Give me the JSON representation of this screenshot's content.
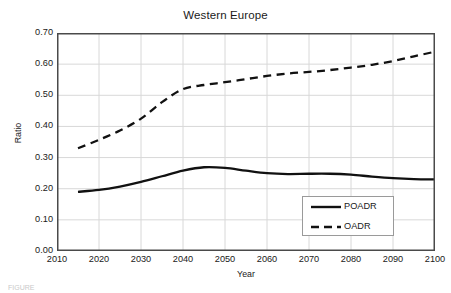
{
  "chart_data": {
    "type": "line",
    "title": "Western Europe",
    "xlabel": "Year",
    "ylabel": "Ratio",
    "xlim": [
      2010,
      2100
    ],
    "ylim": [
      0.0,
      0.7
    ],
    "grid": true,
    "legend_position": "lower-right",
    "xticks": [
      "2010",
      "2020",
      "2030",
      "2040",
      "2050",
      "2060",
      "2070",
      "2080",
      "2090",
      "2100"
    ],
    "yticks": [
      "0.00",
      "0.10",
      "0.20",
      "0.30",
      "0.40",
      "0.50",
      "0.60",
      "0.70"
    ],
    "x": [
      2015,
      2020,
      2025,
      2030,
      2035,
      2040,
      2045,
      2050,
      2055,
      2060,
      2065,
      2070,
      2075,
      2080,
      2085,
      2090,
      2095,
      2100
    ],
    "series": [
      {
        "name": "POADR",
        "style": "solid",
        "color": "#111111",
        "values": [
          0.19,
          0.196,
          0.207,
          0.222,
          0.24,
          0.258,
          0.269,
          0.267,
          0.258,
          0.25,
          0.247,
          0.248,
          0.248,
          0.245,
          0.239,
          0.234,
          0.231,
          0.23
        ]
      },
      {
        "name": "OADR",
        "style": "dashed",
        "color": "#111111",
        "values": [
          0.33,
          0.357,
          0.387,
          0.425,
          0.478,
          0.52,
          0.533,
          0.542,
          0.552,
          0.562,
          0.57,
          0.575,
          0.581,
          0.589,
          0.598,
          0.61,
          0.625,
          0.64
        ]
      }
    ]
  },
  "legend": {
    "items": [
      {
        "label": "POADR",
        "style": "solid"
      },
      {
        "label": "OADR",
        "style": "dashed"
      }
    ]
  },
  "caption": {
    "text": "FIGURE"
  },
  "colors": {
    "axis": "#4a4a4a",
    "grid": "#d8d8d8",
    "series": "#111111",
    "background": "#ffffff"
  }
}
